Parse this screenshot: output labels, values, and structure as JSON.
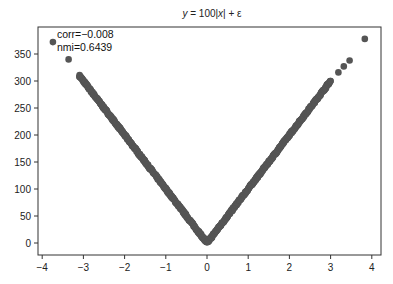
{
  "chart_data": {
    "type": "scatter",
    "title": "y = 100|x| + ε",
    "title_parts": {
      "y": "y",
      "eq": " = 100|",
      "x": "x",
      "rest": "| + ε"
    },
    "xlabel": "",
    "ylabel": "",
    "xlim": [
      -4.1,
      4.2
    ],
    "ylim": [
      -20,
      395
    ],
    "xticks": [
      -4,
      -3,
      -2,
      -1,
      0,
      1,
      2,
      3,
      4
    ],
    "xtick_labels": [
      "−4",
      "−3",
      "−2",
      "−1",
      "0",
      "1",
      "2",
      "3",
      "4"
    ],
    "yticks": [
      0,
      50,
      100,
      150,
      200,
      250,
      300,
      350
    ],
    "ytick_labels": [
      "0",
      "50",
      "100",
      "150",
      "200",
      "250",
      "300",
      "350"
    ],
    "grid": false,
    "marker_color": "#555555",
    "annotations": [
      "corr=−0.008",
      "nmi=0.6439"
    ],
    "series": [
      {
        "name": "samples",
        "description": "dense V-shaped cloud following y = 100|x| for x in approx [-3.1, 3.0] plus outliers",
        "dense_range": [
          -3.1,
          3.0
        ],
        "sparse_points": [
          {
            "x": -3.74,
            "y": 372
          },
          {
            "x": -3.36,
            "y": 340
          },
          {
            "x": 3.19,
            "y": 316
          },
          {
            "x": 3.32,
            "y": 327
          },
          {
            "x": 3.46,
            "y": 338
          },
          {
            "x": 3.83,
            "y": 378
          }
        ]
      }
    ]
  }
}
